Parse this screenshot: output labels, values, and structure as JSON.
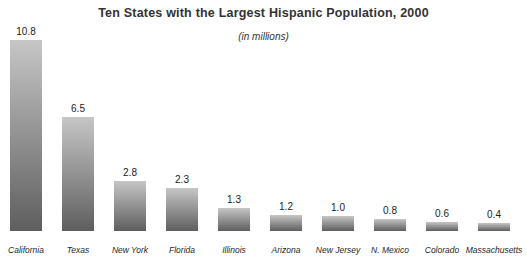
{
  "page": {
    "background": "#ffffff"
  },
  "chart_data": {
    "type": "bar",
    "title": "Ten States with the Largest Hispanic Population, 2000",
    "subtitle": "(in millions)",
    "categories": [
      "California",
      "Texas",
      "New York",
      "Florida",
      "Illinois",
      "Arizona",
      "New Jersey",
      "N. Mexico",
      "Colorado",
      "Massachusetts"
    ],
    "values": [
      10.8,
      6.5,
      2.8,
      2.3,
      1.3,
      1.2,
      1.0,
      0.8,
      0.6,
      0.4
    ],
    "value_labels": [
      "10.8",
      "6.5",
      "2.8",
      "2.3",
      "1.3",
      "1.2",
      "1.0",
      "0.8",
      "0.6",
      "0.4"
    ],
    "ylim": [
      0,
      11
    ],
    "grid": false,
    "legend": "none",
    "data_labels": "above-bars",
    "bar_heights_px": [
      191,
      114,
      50,
      43,
      23,
      16,
      15,
      12,
      9,
      8
    ],
    "colors": {
      "bar_top": "#c6c6c6",
      "bar_bottom": "#5e5e5e",
      "title_text": "#333333",
      "label_text": "#1f1f1f",
      "background": "#ffffff"
    }
  }
}
